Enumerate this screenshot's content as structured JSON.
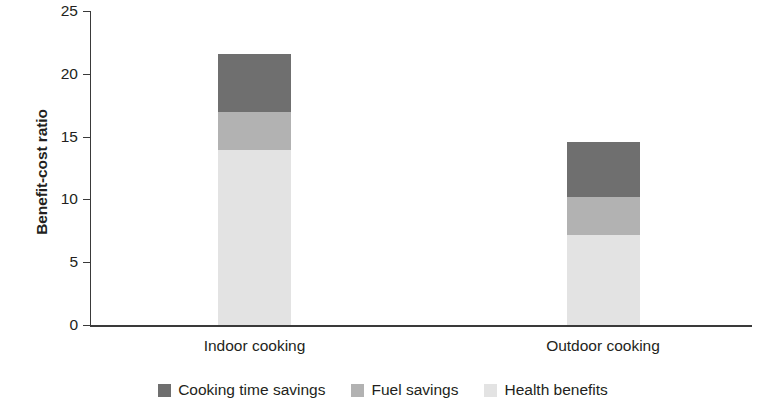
{
  "chart_data": {
    "type": "bar",
    "subtype": "stacked-vertical",
    "title": "",
    "xlabel": "",
    "ylabel": "Benefit-cost ratio",
    "ylim": [
      0,
      25
    ],
    "yticks": [
      0,
      5,
      10,
      15,
      20,
      25
    ],
    "ytick_labels": [
      "0",
      "5",
      "10",
      "15",
      "20",
      "25"
    ],
    "grid": false,
    "legend_position": "bottom-center",
    "categories": [
      "Indoor cooking",
      "Outdoor cooking"
    ],
    "series": [
      {
        "name": "Cooking time savings",
        "color": "#6f6f6f",
        "values": [
          4.6,
          4.4
        ]
      },
      {
        "name": "Fuel savings",
        "color": "#b2b2b2",
        "values": [
          3.1,
          3.0
        ]
      },
      {
        "name": "Health benefits",
        "color": "#e3e3e3",
        "values": [
          13.9,
          7.2
        ]
      }
    ],
    "totals": [
      21.6,
      14.6
    ],
    "stack_order_bottom_to_top": [
      "Health benefits",
      "Fuel savings",
      "Cooking time savings"
    ]
  },
  "axis": {
    "y_title": "Benefit-cost ratio",
    "ticks": [
      {
        "label": "25",
        "value": 25
      },
      {
        "label": "20",
        "value": 20
      },
      {
        "label": "15",
        "value": 15
      },
      {
        "label": "10",
        "value": 10
      },
      {
        "label": "5",
        "value": 5
      },
      {
        "label": "0",
        "value": 0
      }
    ]
  },
  "categories": [
    {
      "label": "Indoor cooking"
    },
    {
      "label": "Outdoor cooking"
    }
  ],
  "legend": {
    "items": [
      {
        "label": "Cooking time savings",
        "color": "#6f6f6f"
      },
      {
        "label": "Fuel savings",
        "color": "#b2b2b2"
      },
      {
        "label": "Health benefits",
        "color": "#e3e3e3"
      }
    ]
  }
}
